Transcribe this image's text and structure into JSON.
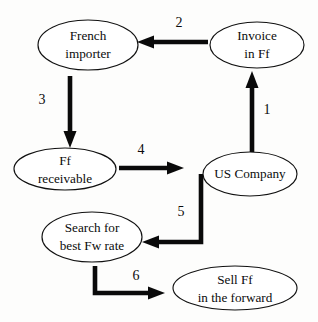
{
  "diagram": {
    "type": "flowchart",
    "canvas": {
      "width": 318,
      "height": 322,
      "background": "#fdfdfc"
    },
    "colors": {
      "node_fill": "#ffffff",
      "node_stroke": "#111111",
      "arrow": "#0a0a0a",
      "text": "#0b0b0b"
    },
    "nodes": [
      {
        "id": "french-importer",
        "lines": [
          "French",
          "importer"
        ],
        "line1": "French",
        "line2": "importer",
        "cx": 88,
        "cy": 45,
        "rx": 50,
        "ry": 25
      },
      {
        "id": "invoice-in-ff",
        "lines": [
          "Invoice",
          "in Ff"
        ],
        "line1": "Invoice",
        "line2": "in Ff",
        "cx": 257,
        "cy": 45,
        "rx": 47,
        "ry": 23
      },
      {
        "id": "ff-receivable",
        "lines": [
          "Ff",
          "receivable"
        ],
        "line1": "Ff",
        "line2": "receivable",
        "cx": 65,
        "cy": 169,
        "rx": 51,
        "ry": 21
      },
      {
        "id": "us-company",
        "lines": [
          "US Company"
        ],
        "line1": "US Company",
        "line2": "",
        "cx": 250,
        "cy": 174,
        "rx": 47,
        "ry": 22
      },
      {
        "id": "search-best-fw-rate",
        "lines": [
          "Search for",
          "best Fw rate"
        ],
        "line1": "Search for",
        "line2": "best Fw rate",
        "cx": 92,
        "cy": 237,
        "rx": 50,
        "ry": 25
      },
      {
        "id": "sell-ff-forward",
        "lines": [
          "Sell Ff",
          "in the forward"
        ],
        "line1": "Sell Ff",
        "line2": "in the forward",
        "cx": 235,
        "cy": 288,
        "rx": 62,
        "ry": 22
      }
    ],
    "edges": [
      {
        "id": "edge-1",
        "label": "1",
        "from": "us-company",
        "to": "invoice-in-ff",
        "direction": "up",
        "label_x": 267,
        "label_y": 111
      },
      {
        "id": "edge-2",
        "label": "2",
        "from": "invoice-in-ff",
        "to": "french-importer",
        "direction": "left",
        "label_x": 179,
        "label_y": 24
      },
      {
        "id": "edge-3",
        "label": "3",
        "from": "french-importer",
        "to": "ff-receivable",
        "direction": "down",
        "label_x": 42,
        "label_y": 101
      },
      {
        "id": "edge-4",
        "label": "4",
        "from": "ff-receivable",
        "to": "us-company",
        "direction": "right",
        "label_x": 141,
        "label_y": 151
      },
      {
        "id": "edge-5",
        "label": "5",
        "from": "us-company",
        "to": "search-best-fw-rate",
        "direction": "elbow-down-left",
        "label_x": 181,
        "label_y": 213
      },
      {
        "id": "edge-6",
        "label": "6",
        "from": "search-best-fw-rate",
        "to": "sell-ff-forward",
        "direction": "elbow-down-right",
        "label_x": 136,
        "label_y": 277
      }
    ]
  }
}
